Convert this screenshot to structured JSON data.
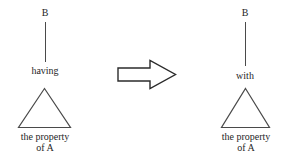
{
  "diagram": {
    "type": "transformation-rule",
    "left": {
      "top_node": "B",
      "relation": "having",
      "shape": "triangle",
      "caption_line1": "the property",
      "caption_line2": "of A"
    },
    "operator": {
      "icon": "right-block-arrow",
      "meaning": "rewrites to"
    },
    "right": {
      "top_node": "B",
      "relation": "with",
      "shape": "triangle",
      "caption_line1": "the property",
      "caption_line2": "of A"
    }
  },
  "colors": {
    "background": "#ffffff",
    "stroke": "#4a4a4a",
    "text": "#262626"
  }
}
